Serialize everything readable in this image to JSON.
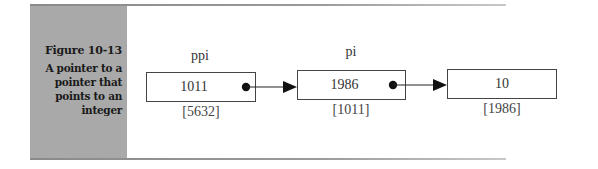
{
  "figure": {
    "number": "Figure 10-13",
    "caption_lines": [
      "A pointer to a",
      "pointer that",
      "points to an",
      "integer"
    ]
  },
  "diagram": {
    "nodes": [
      {
        "name": "ppi",
        "value": "1011",
        "address": "[5632]",
        "has_pointer": true
      },
      {
        "name": "pi",
        "value": "1986",
        "address": "[1011]",
        "has_pointer": true
      },
      {
        "name": "",
        "value": "10",
        "address": "[1986]",
        "has_pointer": false
      }
    ],
    "edges": [
      {
        "from": "ppi",
        "to": "pi"
      },
      {
        "from": "pi",
        "to": "integer-10"
      }
    ]
  }
}
